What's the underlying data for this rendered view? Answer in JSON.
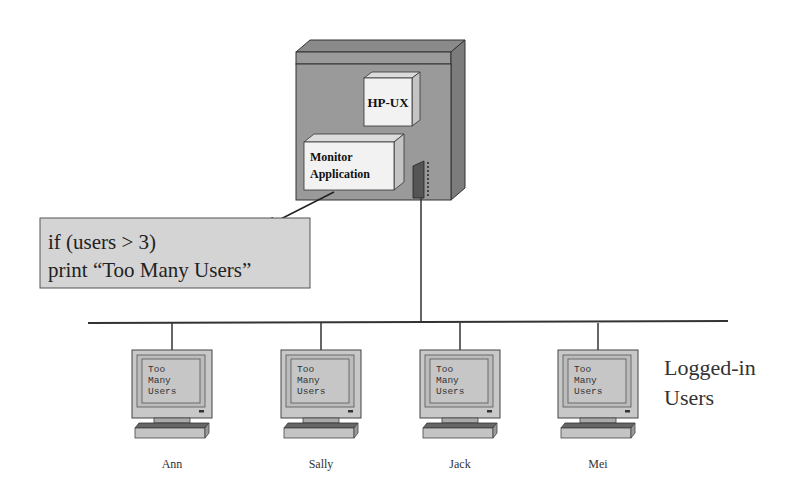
{
  "server": {
    "os_label": "HP-UX",
    "app_label_line1": "Monitor",
    "app_label_line2": "Application"
  },
  "code_box": {
    "line1": "if  (users > 3)",
    "line2": "print  “Too Many Users”"
  },
  "terminals": [
    {
      "name": "Ann",
      "screen": [
        "Too",
        "Many",
        "Users"
      ]
    },
    {
      "name": "Sally",
      "screen": [
        "Too",
        "Many",
        "Users"
      ]
    },
    {
      "name": "Jack",
      "screen": [
        "Too",
        "Many",
        "Users"
      ]
    },
    {
      "name": "Mei",
      "screen": [
        "Too",
        "Many",
        "Users"
      ]
    }
  ],
  "group_label": {
    "line1": "Logged-in",
    "line2": "Users"
  },
  "colors": {
    "server_body": "#9a9a9a",
    "server_top": "#8a8a8a",
    "server_side": "#7c7c7c",
    "box_face": "#f2f2f2",
    "code_box_fill": "#d4d4d4",
    "monitor_fill": "#c8c8c8",
    "line": "#333333"
  }
}
